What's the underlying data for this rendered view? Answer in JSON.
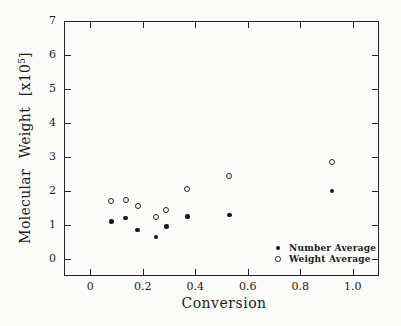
{
  "figure": {
    "background": "#fbfbf9",
    "ink": "#1c1c1c"
  },
  "chart_data": {
    "type": "scatter",
    "title": "",
    "xlabel": "Conversion",
    "ylabel": "Molecular Weight [x10^5]",
    "ylabel_parts": {
      "prefix": "Molecular Weight [x10",
      "superscript": "5",
      "suffix": "]"
    },
    "xlim": [
      -0.1,
      1.1
    ],
    "ylim": [
      -0.5,
      7.0
    ],
    "xticks": [
      0,
      0.2,
      0.4,
      0.6,
      0.8,
      1.0
    ],
    "xtick_labels": [
      "0",
      "0.2",
      "0.4",
      "0.6",
      "0.8",
      "1.0"
    ],
    "yticks": [
      0,
      1,
      2,
      3,
      4,
      5,
      6,
      7
    ],
    "ytick_labels": [
      "0",
      "1",
      "2",
      "3",
      "4",
      "5",
      "6",
      "7"
    ],
    "grid": false,
    "legend_position": "inside lower right",
    "series": [
      {
        "name": "Number Average",
        "marker": "filled-circle",
        "points": [
          [
            0.08,
            1.1
          ],
          [
            0.135,
            1.2
          ],
          [
            0.18,
            0.85
          ],
          [
            0.25,
            0.65
          ],
          [
            0.29,
            0.95
          ],
          [
            0.37,
            1.25
          ],
          [
            0.53,
            1.3
          ],
          [
            0.92,
            2.0
          ]
        ]
      },
      {
        "name": "Weight Average",
        "marker": "open-circle",
        "points": [
          [
            0.08,
            1.7
          ],
          [
            0.135,
            1.75
          ],
          [
            0.18,
            1.55
          ],
          [
            0.25,
            1.25
          ],
          [
            0.29,
            1.45
          ],
          [
            0.37,
            2.05
          ],
          [
            0.53,
            2.45
          ],
          [
            0.92,
            2.85
          ]
        ]
      }
    ]
  }
}
